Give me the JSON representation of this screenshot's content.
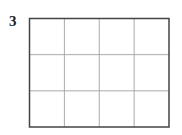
{
  "problem_number": "3",
  "grid": {
    "rows": 3,
    "columns": 4
  },
  "colors": {
    "border": "#444444",
    "gridline": "#aaaaaa"
  }
}
